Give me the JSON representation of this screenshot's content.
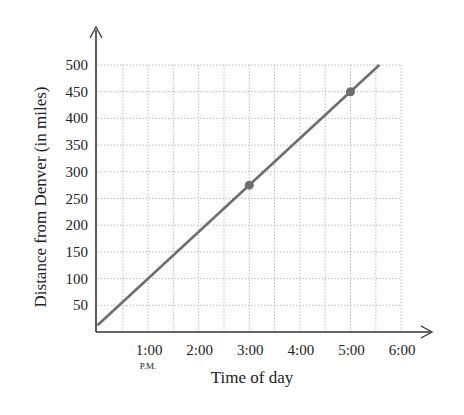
{
  "chart_data": {
    "type": "line",
    "title": "",
    "xlabel": "Time of day",
    "ylabel": "Distance from Denver (in miles)",
    "x_ticks": [
      "1:00",
      "2:00",
      "3:00",
      "4:00",
      "5:00",
      "6:00"
    ],
    "x_tick_values": [
      1,
      2,
      3,
      4,
      5,
      6
    ],
    "x_tick_sublabel": {
      "index": 0,
      "text": "P.M."
    },
    "y_ticks": [
      50,
      100,
      150,
      200,
      250,
      300,
      350,
      400,
      450,
      500
    ],
    "xlim": [
      0,
      6
    ],
    "ylim": [
      0,
      500
    ],
    "grid": {
      "on": true,
      "style": "dotted",
      "x_step_hours": 0.5,
      "y_step": 50
    },
    "series": [
      {
        "name": "Distance",
        "x": [
          0,
          3,
          5,
          5.57
        ],
        "y": [
          12.5,
          275,
          450,
          500
        ],
        "color": "#6e6e6e"
      }
    ],
    "highlighted_points": [
      {
        "time": "3:00",
        "x": 3,
        "y": 275
      },
      {
        "time": "5:00",
        "x": 5,
        "y": 450
      }
    ],
    "legend": null,
    "colors": {
      "line": "#6e6e6e",
      "axis": "#333333",
      "grid": "#9a9a9a",
      "text": "#222222"
    }
  }
}
